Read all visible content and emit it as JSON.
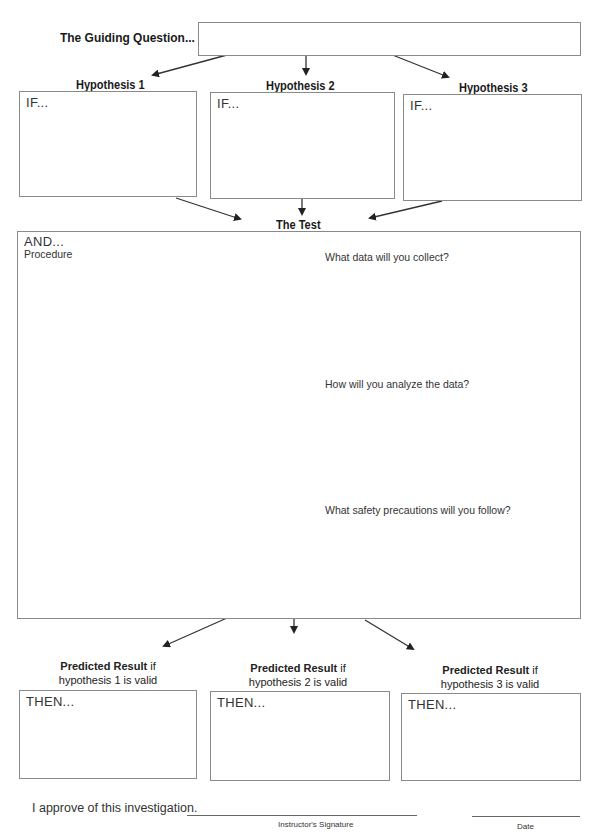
{
  "guiding_question": {
    "label": "The Guiding Question...",
    "value": ""
  },
  "hypotheses": [
    {
      "label": "Hypothesis 1",
      "lead": "IF...",
      "value": ""
    },
    {
      "label": "Hypothesis 2",
      "lead": "IF...",
      "value": ""
    },
    {
      "label": "Hypothesis 3",
      "lead": "IF...",
      "value": ""
    }
  ],
  "test": {
    "label": "The Test",
    "lead": "AND...",
    "procedure_label": "Procedure",
    "questions": [
      "What data will you collect?",
      "How will you analyze the data?",
      "What safety precautions will you follow?"
    ]
  },
  "predicted_results": [
    {
      "label_bold": "Predicted Result",
      "label_rest": " if",
      "sub": "hypothesis 1 is valid",
      "lead": "THEN...",
      "value": ""
    },
    {
      "label_bold": "Predicted Result",
      "label_rest": " if",
      "sub": "hypothesis 2 is valid",
      "lead": "THEN...",
      "value": ""
    },
    {
      "label_bold": "Predicted Result",
      "label_rest": " if",
      "sub": "hypothesis 3 is valid",
      "lead": "THEN...",
      "value": ""
    }
  ],
  "approval": {
    "statement": "I approve of this investigation.",
    "signature_caption": "Instructor's Signature",
    "date_caption": "Date"
  }
}
